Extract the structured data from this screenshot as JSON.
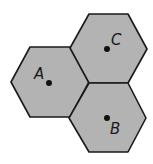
{
  "diagram": {
    "fill_color": "#b3b3b3",
    "stroke_color": "#1a1a1a",
    "cells": [
      {
        "label": "A",
        "points": "11,82 30,47 70,47 89,82 70,117 30,117",
        "dot": [
          49,
          83
        ],
        "label_pos": [
          34,
          79
        ]
      },
      {
        "label": "C",
        "points": "70,48 89,14 128,14 147,49 128,83 89,83",
        "dot": [
          107,
          49
        ],
        "label_pos": [
          111,
          45
        ]
      },
      {
        "label": "B",
        "points": "69,118 89,83 128,83 146,118 128,152 89,152",
        "dot": [
          107,
          118
        ],
        "label_pos": [
          110,
          134
        ]
      }
    ]
  }
}
